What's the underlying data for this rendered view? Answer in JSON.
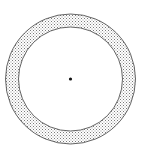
{
  "diagram": {
    "type": "annulus",
    "center": {
      "x": 70.5,
      "y": 79
    },
    "outer_radius": 65,
    "inner_radius": 52,
    "center_dot_radius": 1.6,
    "colors": {
      "background": "#ffffff",
      "stroke": "#555555",
      "stipple": "#6a6a6a",
      "dot": "#111111"
    }
  }
}
